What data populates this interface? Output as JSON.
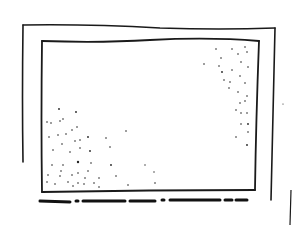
{
  "sketch": {
    "ink_color": "#1a1a1a",
    "background": "#ffffff",
    "outer_frame": {
      "x1": 23,
      "y1": 25,
      "x2": 275,
      "y2": 200
    },
    "inner_frame": {
      "x1": 42,
      "y1": 41,
      "x2": 259,
      "y2": 192
    },
    "caption": {
      "text": "",
      "style": "illegible-scribble"
    },
    "stipple_regions": [
      "bottom-left",
      "top-right"
    ]
  }
}
